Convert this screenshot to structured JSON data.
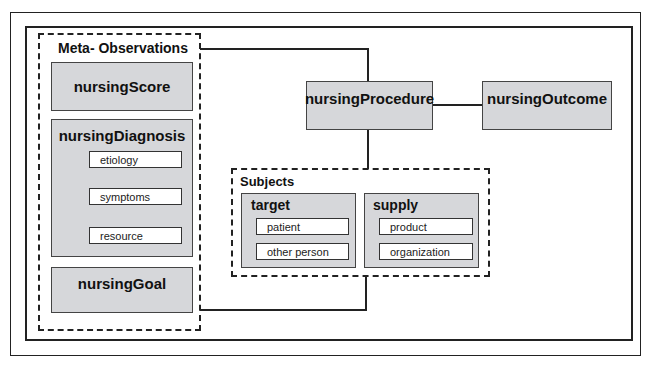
{
  "diagram": {
    "meta_group": {
      "title": "Meta- Observations",
      "nursingScore": "nursingScore",
      "nursingDiagnosis": {
        "title": "nursingDiagnosis",
        "fields": [
          "etiology",
          "symptoms",
          "resource"
        ]
      },
      "nursingGoal": "nursingGoal"
    },
    "nursingProcedure": "nursingProcedure",
    "nursingOutcome": "nursingOutcome",
    "subjects": {
      "title": "Subjects",
      "target": {
        "title": "target",
        "fields": [
          "patient",
          "other person"
        ]
      },
      "supply": {
        "title": "supply",
        "fields": [
          "product",
          "organization"
        ]
      }
    }
  }
}
